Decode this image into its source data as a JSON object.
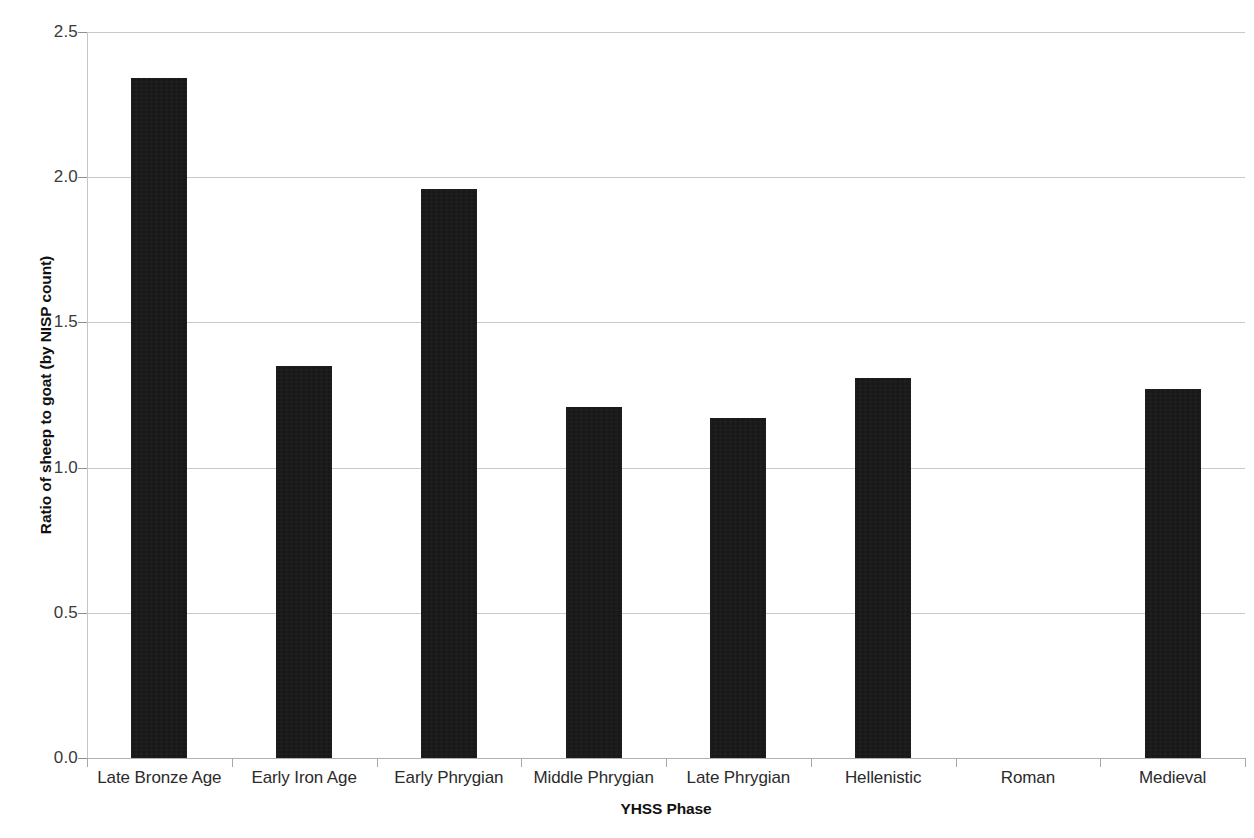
{
  "chart_data": {
    "type": "bar",
    "title": "",
    "xlabel": "YHSS Phase",
    "ylabel": "Ratio of sheep to goat (by NISP count)",
    "categories": [
      "Late Bronze Age",
      "Early Iron Age",
      "Early Phrygian",
      "Middle Phrygian",
      "Late Phrygian",
      "Hellenistic",
      "Roman",
      "Medieval"
    ],
    "values": [
      2.34,
      1.35,
      1.96,
      1.21,
      1.17,
      1.31,
      0,
      1.27
    ],
    "ylim": [
      0.0,
      2.5
    ],
    "ytick_labels": [
      "0.0",
      "0.5",
      "1.0",
      "1.5",
      "2.0",
      "2.5"
    ],
    "ytick_values": [
      0.0,
      0.5,
      1.0,
      1.5,
      2.0,
      2.5
    ],
    "grid": true,
    "legend": false,
    "bar_color": "#141414",
    "gridline_color": "#c9c9c9",
    "axis_color": "#b0b0b0"
  }
}
